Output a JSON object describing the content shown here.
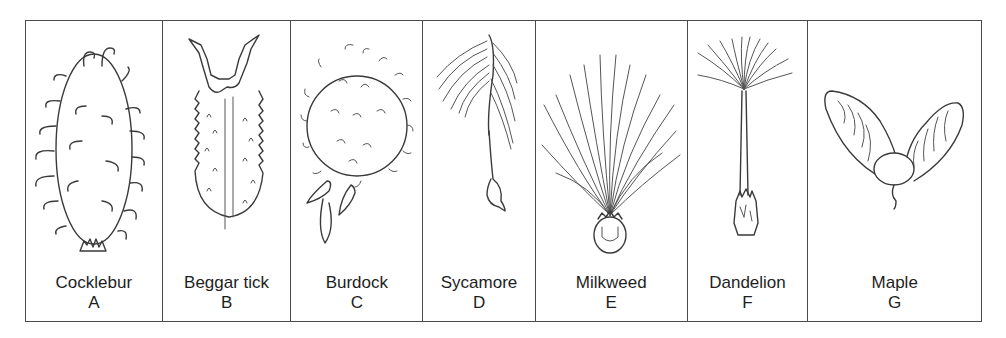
{
  "figure": {
    "panels": [
      {
        "name": "Cocklebur",
        "letter": "A",
        "icon": "cocklebur-seed-icon"
      },
      {
        "name": "Beggar tick",
        "letter": "B",
        "icon": "beggar-tick-seed-icon"
      },
      {
        "name": "Burdock",
        "letter": "C",
        "icon": "burdock-seed-icon"
      },
      {
        "name": "Sycamore",
        "letter": "D",
        "icon": "sycamore-seed-icon"
      },
      {
        "name": "Milkweed",
        "letter": "E",
        "icon": "milkweed-seed-icon"
      },
      {
        "name": "Dandelion",
        "letter": "F",
        "icon": "dandelion-seed-icon"
      },
      {
        "name": "Maple",
        "letter": "G",
        "icon": "maple-seed-icon"
      }
    ]
  },
  "colors": {
    "line": "#3a3a3a",
    "border": "#4a4a4a",
    "background": "#ffffff",
    "text": "#1e1e1e"
  }
}
